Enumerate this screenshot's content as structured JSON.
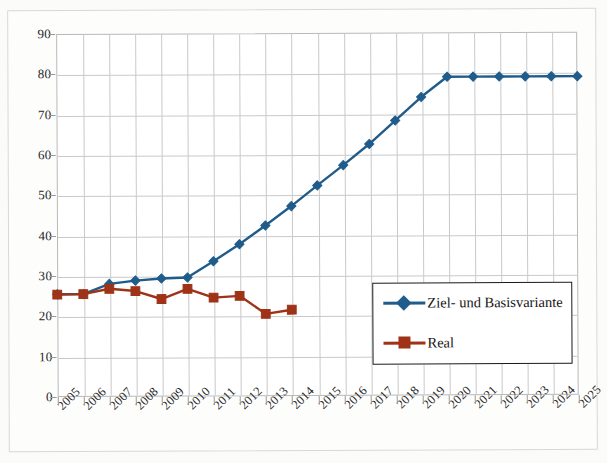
{
  "chart_data": {
    "type": "line",
    "title": "",
    "subtitle": "",
    "xlabel": "",
    "ylabel": "",
    "xlim": [
      2005,
      2025
    ],
    "ylim": [
      0,
      90
    ],
    "ytick_step": 10,
    "grid": "both",
    "legend_position": "inside lower-right",
    "categories": [
      "2005",
      "2006",
      "2007",
      "2008",
      "2009",
      "2010",
      "2011",
      "2012",
      "2013",
      "2014",
      "2015",
      "2016",
      "2017",
      "2018",
      "2019",
      "2020",
      "2021",
      "2022",
      "2023",
      "2024",
      "2025"
    ],
    "yticks": [
      "0",
      "10",
      "20",
      "30",
      "40",
      "50",
      "60",
      "70",
      "80",
      "90"
    ],
    "series": [
      {
        "name": "Ziel- und Basisvariante",
        "color": "#1f5c8b",
        "marker": "diamond",
        "values": [
          25.5,
          25.5,
          28.0,
          28.8,
          29.3,
          29.5,
          33.5,
          37.7,
          42.3,
          47.1,
          52.2,
          57.2,
          62.4,
          68.2,
          74.0,
          79.0,
          79.0,
          79.0,
          79.0,
          79.0,
          79.0
        ]
      },
      {
        "name": "Real",
        "color": "#9e3318",
        "marker": "square",
        "values": [
          25.4,
          25.5,
          26.8,
          26.2,
          24.2,
          26.7,
          24.5,
          24.9,
          20.4,
          21.4,
          null,
          null,
          null,
          null,
          null,
          null,
          null,
          null,
          null,
          null,
          null
        ]
      }
    ]
  },
  "legend": {
    "entries": [
      {
        "label": "Ziel- und Basisvariante"
      },
      {
        "label": "Real"
      }
    ]
  },
  "colors": {
    "series_blue": "#1f5c8b",
    "series_red": "#9e3318",
    "grid": "#c9c9c9",
    "axis": "#b9b9b9",
    "background": "#ffffff",
    "paper": "#fbfbfa"
  }
}
